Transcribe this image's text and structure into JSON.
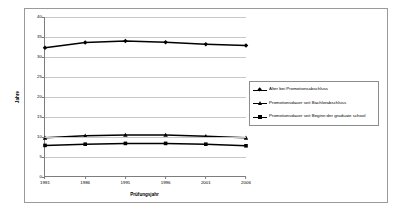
{
  "chart_data": {
    "type": "line",
    "title": "",
    "xlabel": "Prüfungsjahr",
    "ylabel": "Jahre",
    "x": [
      1981,
      1986,
      1991,
      1996,
      2001,
      2006
    ],
    "categories": [
      "1981",
      "1986",
      "1991",
      "1996",
      "2001",
      "2006"
    ],
    "ylim": [
      0,
      40
    ],
    "yticks": [
      0,
      5,
      10,
      15,
      20,
      25,
      30,
      35,
      40
    ],
    "ytick_labels": [
      "0",
      "5",
      "10",
      "15",
      "20",
      "25",
      "30",
      "35",
      "40"
    ],
    "grid": true,
    "grid_axis": "y",
    "legend_position": "right",
    "series": [
      {
        "name": "Alter bei Promotionsabschluss",
        "marker": "diamond",
        "color": "#000000",
        "values": [
          32.3,
          33.6,
          34.0,
          33.7,
          33.2,
          32.9
        ]
      },
      {
        "name": "Promotionsdauer seit Bachlorabschluss",
        "marker": "triangle",
        "color": "#000000",
        "values": [
          9.8,
          10.3,
          10.5,
          10.5,
          10.2,
          9.8
        ]
      },
      {
        "name": "Promotionsdauer seit Beginn der graduate school",
        "marker": "square",
        "color": "#000000",
        "values": [
          7.9,
          8.2,
          8.4,
          8.4,
          8.2,
          7.8
        ]
      }
    ]
  },
  "axes": {
    "x_title": "Prüfungsjahr",
    "y_title": "Jahre"
  },
  "legend": {
    "items": [
      {
        "label": "Alter bei Promotionsabschluss"
      },
      {
        "label": "Promotionsdauer seit Bachlorabschluss"
      },
      {
        "label": "Promotionsdauer seit Beginn der graduate school"
      }
    ]
  },
  "style": {
    "grid_color": "#c8c8c8",
    "axis_color": "#7d7d7d",
    "series_color": "#000000",
    "frame_color": "#9a9a9a",
    "background": "#ffffff"
  }
}
